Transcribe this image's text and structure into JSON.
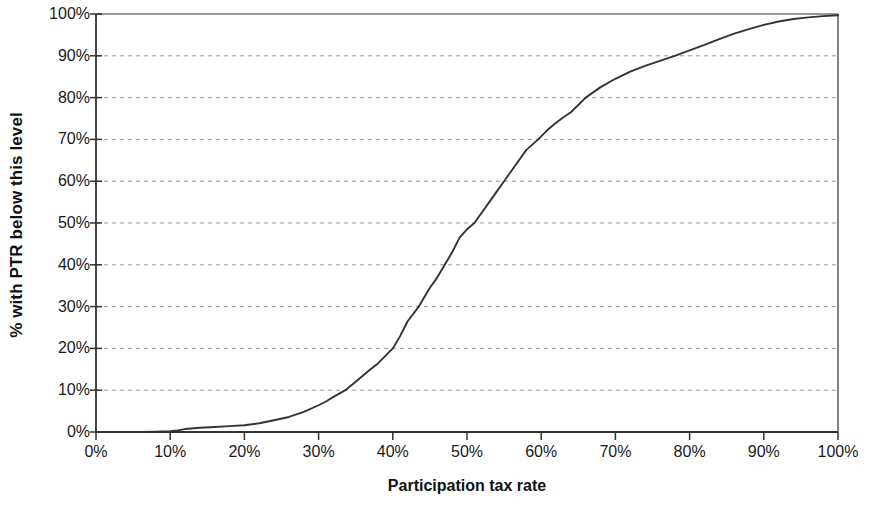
{
  "chart_data": {
    "type": "line",
    "title": "",
    "subtitle": "",
    "xlabel": "Participation tax rate",
    "ylabel": "% with PTR below this level",
    "xlim": [
      0,
      100
    ],
    "ylim": [
      0,
      100
    ],
    "grid": "horizontal-dashed",
    "legend": "none",
    "x_ticks": [
      "0%",
      "10%",
      "20%",
      "30%",
      "40%",
      "50%",
      "60%",
      "70%",
      "80%",
      "90%",
      "100%"
    ],
    "y_ticks": [
      "0%",
      "10%",
      "20%",
      "30%",
      "40%",
      "50%",
      "60%",
      "70%",
      "80%",
      "90%",
      "100%"
    ],
    "x_tick_values": [
      0,
      10,
      20,
      30,
      40,
      50,
      60,
      70,
      80,
      90,
      100
    ],
    "y_tick_values": [
      0,
      10,
      20,
      30,
      40,
      50,
      60,
      70,
      80,
      90,
      100
    ],
    "line_color": "#333333",
    "grid_color": "#999999",
    "axis_color": "#333333",
    "background_color": "#ffffff",
    "series": [
      {
        "name": "Cumulative distribution of participation tax rates",
        "x": [
          0,
          2,
          4,
          6,
          8,
          10,
          11,
          12,
          14,
          16,
          18,
          20,
          22,
          24,
          26,
          28,
          30,
          31,
          32,
          33.6,
          35,
          36,
          37,
          38,
          39,
          40,
          41,
          42,
          43.5,
          45,
          46,
          47,
          48,
          49,
          50,
          51,
          52,
          53,
          54,
          55,
          56,
          57,
          58,
          59.6,
          61,
          62,
          63,
          64,
          66,
          68,
          70,
          72,
          74,
          76,
          78,
          80,
          82,
          84,
          86,
          88,
          90,
          92,
          94,
          96,
          98,
          100
        ],
        "y": [
          0,
          0,
          0,
          0,
          0.1,
          0.2,
          0.4,
          0.7,
          1.0,
          1.2,
          1.4,
          1.6,
          2.1,
          2.8,
          3.6,
          4.8,
          6.4,
          7.3,
          8.4,
          10.0,
          12.0,
          13.5,
          15.0,
          16.4,
          18.2,
          20.0,
          23.0,
          26.5,
          30.0,
          34.5,
          37.0,
          40.0,
          43.0,
          46.5,
          48.5,
          50.0,
          52.5,
          55.0,
          57.5,
          60.0,
          62.5,
          65.0,
          67.5,
          70.0,
          72.5,
          74.0,
          75.3,
          76.5,
          80.0,
          82.5,
          84.5,
          86.2,
          87.6,
          88.8,
          90.0,
          91.3,
          92.6,
          94.0,
          95.3,
          96.4,
          97.4,
          98.2,
          98.8,
          99.2,
          99.5,
          99.7
        ]
      }
    ],
    "annotations": []
  }
}
